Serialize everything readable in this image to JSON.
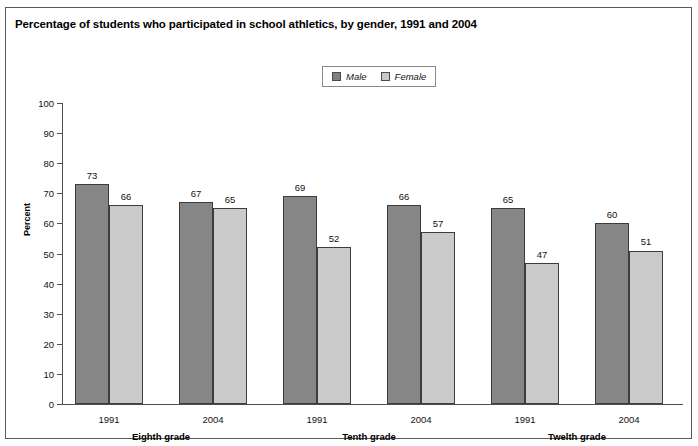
{
  "title": "Percentage of students who participated in school athletics, by gender, 1991 and 2004",
  "legend": {
    "items": [
      {
        "label": "Male",
        "color": "#868686"
      },
      {
        "label": "Female",
        "color": "#cacaca"
      }
    ]
  },
  "axis": {
    "ylabel": "Percent",
    "yticks": [
      "0",
      "10",
      "20",
      "30",
      "40",
      "50",
      "60",
      "70",
      "80",
      "90",
      "100"
    ]
  },
  "chart_data": {
    "type": "bar",
    "title": "Percentage of students who participated in school athletics, by gender, 1991 and 2004",
    "xlabel": "",
    "ylabel": "Percent",
    "ylim": [
      0,
      100
    ],
    "ytick_step": 10,
    "grid": false,
    "legend_position": "top-center",
    "categories": [
      "1991",
      "2004",
      "1991",
      "2004",
      "1991",
      "2004"
    ],
    "groups": [
      {
        "name": "Eighth grade",
        "categories": [
          "1991",
          "2004"
        ]
      },
      {
        "name": "Tenth grade",
        "categories": [
          "1991",
          "2004"
        ]
      },
      {
        "name": "Twelth grade",
        "categories": [
          "1991",
          "2004"
        ]
      }
    ],
    "series": [
      {
        "name": "Male",
        "color": "#868686",
        "values": [
          73,
          67,
          69,
          66,
          65,
          60
        ]
      },
      {
        "name": "Female",
        "color": "#cacaca",
        "values": [
          66,
          65,
          52,
          57,
          47,
          51
        ]
      }
    ]
  }
}
